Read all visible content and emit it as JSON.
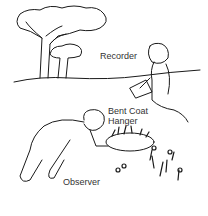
{
  "figure": {
    "labels": {
      "recorder": "Recorder",
      "hanger_line1": "Bent Coat",
      "hanger_line2": "Hanger",
      "observer": "Observer"
    },
    "colors": {
      "ink": "#1a1a1a",
      "background": "#ffffff"
    }
  }
}
